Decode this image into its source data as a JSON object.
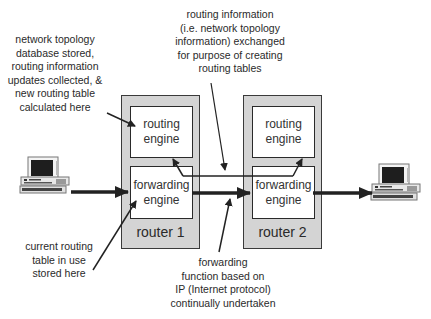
{
  "annotations": {
    "topology_db": "network topology\ndatabase stored,\nrouting information\nupdates collected, &\nnew routing table\ncalculated here",
    "routing_exchange": "routing information\n(i.e. network topology\ninformation) exchanged\nfor purpose of creating\nrouting tables",
    "current_table": "current routing\ntable in use\nstored here",
    "forwarding_function": "forwarding\nfunction based on\nIP (Internet protocol)\ncontinually undertaken"
  },
  "routers": [
    {
      "name": "router 1",
      "routing_engine": "routing\nengine",
      "forwarding_engine": "forwarding\nengine"
    },
    {
      "name": "router 2",
      "routing_engine": "routing\nengine",
      "forwarding_engine": "forwarding\nengine"
    }
  ],
  "hosts": [
    {
      "icon": "desktop-computer-icon",
      "side": "left"
    },
    {
      "icon": "desktop-computer-icon",
      "side": "right"
    }
  ],
  "colors": {
    "router_fill": "#d4d4d4",
    "engine_fill": "#ffffff",
    "line": "#222222"
  }
}
